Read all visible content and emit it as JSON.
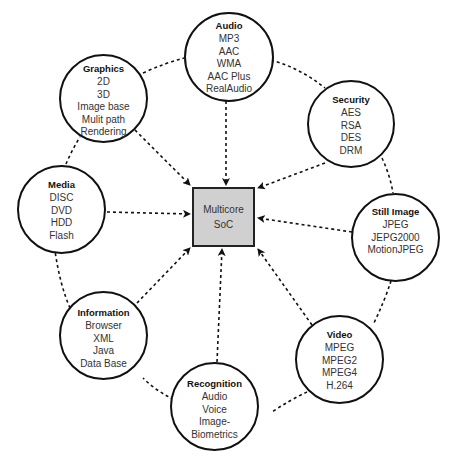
{
  "diagram": {
    "center": {
      "line1": "Multicore",
      "line2": "SoC"
    },
    "nodes": [
      {
        "id": "audio",
        "title": "Audio",
        "items": [
          "MP3",
          "AAC",
          "WMA",
          "AAC Plus",
          "RealAudio"
        ]
      },
      {
        "id": "graphics",
        "title": "Graphics",
        "items": [
          "2D",
          "3D",
          "Image base",
          "Mulit path",
          "Rendering"
        ]
      },
      {
        "id": "security",
        "title": "Security",
        "items": [
          "AES",
          "RSA",
          "DES",
          "DRM"
        ]
      },
      {
        "id": "media",
        "title": "Media",
        "items": [
          "DISC",
          "DVD",
          "HDD",
          "Flash"
        ]
      },
      {
        "id": "still-image",
        "title": "Still Image",
        "items": [
          "JPEG",
          "JEPG2000",
          "MotionJPEG"
        ]
      },
      {
        "id": "information",
        "title": "Information",
        "items": [
          "Browser",
          "XML",
          "Java",
          "Data Base"
        ]
      },
      {
        "id": "video",
        "title": "Video",
        "items": [
          "MPEG",
          "MPEG2",
          "MPEG4",
          "H.264"
        ]
      },
      {
        "id": "recognition",
        "title": "Recognition",
        "items": [
          "Audio",
          "Voice",
          "Image-",
          "Biometrics"
        ]
      }
    ],
    "colors": {
      "center_fill": "#d0d0d0",
      "stroke": "#111111"
    }
  }
}
